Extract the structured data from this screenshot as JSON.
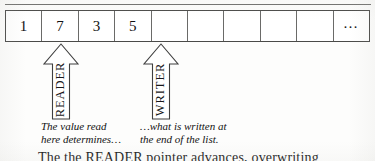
{
  "figure": {
    "kind": "list-reader-writer-diagram",
    "list": {
      "cells": [
        {
          "value": "1"
        },
        {
          "value": "7"
        },
        {
          "value": "3"
        },
        {
          "value": "5"
        },
        {
          "value": ""
        },
        {
          "value": ""
        },
        {
          "value": ""
        },
        {
          "value": ""
        },
        {
          "value": ""
        },
        {
          "value": "…"
        }
      ]
    },
    "pointers": [
      {
        "id": "reader",
        "label": "READER",
        "caption": "The value read\nhere determines…",
        "points_to_cell_index": 1
      },
      {
        "id": "writer",
        "label": "WRITER",
        "caption": "…what is written at\nthe end of the list.",
        "points_to_cell_index": 4
      }
    ],
    "body_text_cut_off": "The the READER pointer advances, overwriting",
    "colors": {
      "ink": "#1a1a1a",
      "rule": "#6f6f6d",
      "cell_border": "#6a6a68",
      "outline": "#4a4a48",
      "page": "#fdfdfc"
    }
  }
}
